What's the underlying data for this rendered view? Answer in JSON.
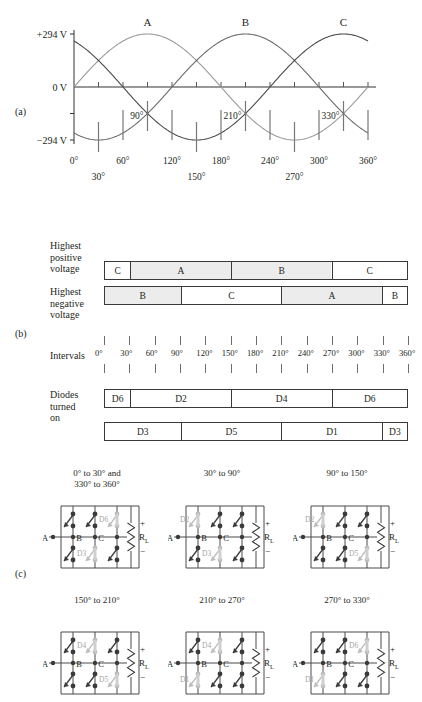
{
  "figure": {
    "panel_labels": {
      "a": "(a)",
      "b": "(b)",
      "c": "(c)"
    }
  },
  "chart_data": {
    "type": "line",
    "title": "",
    "xlabel": "",
    "ylabel": "",
    "xlim": [
      0,
      360
    ],
    "ylim": [
      -294,
      294
    ],
    "grid": false,
    "legend_position": "above-peaks",
    "y_tick_labels": [
      "+294 V",
      "0 V",
      "−294 V"
    ],
    "y_tick_values": [
      294,
      0,
      -294
    ],
    "x_tick_labels_upper": [
      "0°",
      "60°",
      "120°",
      "180°",
      "240°",
      "300°",
      "360°"
    ],
    "x_tick_values_upper": [
      0,
      60,
      120,
      180,
      240,
      300,
      360
    ],
    "x_tick_labels_lower": [
      "30°",
      "150°",
      "270°"
    ],
    "x_tick_values_lower": [
      30,
      150,
      270
    ],
    "inline_annotations": [
      "90°",
      "210°",
      "330°"
    ],
    "inline_annotation_values": [
      90,
      210,
      330
    ],
    "series": [
      {
        "name": "A",
        "phase_deg": 90,
        "amplitude": 294,
        "color": "#9a9a9a",
        "label": "A",
        "label_at_deg": 90
      },
      {
        "name": "B",
        "phase_deg": 210,
        "amplitude": 294,
        "color": "#6b6b6b",
        "label": "B",
        "label_at_deg": 210
      },
      {
        "name": "C",
        "phase_deg": 330,
        "amplitude": 294,
        "color": "#4a4a4a",
        "label": "C",
        "label_at_deg": 330
      }
    ]
  },
  "panel_b": {
    "rows": [
      {
        "label": "Highest\npositive\nvoltage",
        "label_lines": [
          "Highest",
          "positive",
          "voltage"
        ],
        "name": "highest-positive-voltage",
        "segments": [
          {
            "text": "C",
            "start_deg": 0,
            "end_deg": 30,
            "shaded": false
          },
          {
            "text": "A",
            "start_deg": 30,
            "end_deg": 150,
            "shaded": true
          },
          {
            "text": "B",
            "start_deg": 150,
            "end_deg": 270,
            "shaded": true
          },
          {
            "text": "C",
            "start_deg": 270,
            "end_deg": 360,
            "shaded": false
          }
        ]
      },
      {
        "label_lines": [
          "Highest",
          "negative",
          "voltage"
        ],
        "name": "highest-negative-voltage",
        "segments": [
          {
            "text": "B",
            "start_deg": 0,
            "end_deg": 90,
            "shaded": true
          },
          {
            "text": "C",
            "start_deg": 90,
            "end_deg": 210,
            "shaded": false
          },
          {
            "text": "A",
            "start_deg": 210,
            "end_deg": 330,
            "shaded": true
          },
          {
            "text": "B",
            "start_deg": 330,
            "end_deg": 360,
            "shaded": false
          }
        ]
      }
    ],
    "intervals": {
      "label": "Intervals",
      "ticks": [
        "0°",
        "30°",
        "60°",
        "90°",
        "120°",
        "150°",
        "180°",
        "210°",
        "240°",
        "270°",
        "300°",
        "330°",
        "360°"
      ],
      "tick_values": [
        0,
        30,
        60,
        90,
        120,
        150,
        180,
        210,
        240,
        270,
        300,
        330,
        360
      ]
    },
    "diodes": {
      "label_lines": [
        "Diodes",
        "turned",
        "on"
      ],
      "rows": [
        {
          "name": "diodes-upper",
          "segments": [
            {
              "text": "D6",
              "start_deg": 0,
              "end_deg": 30
            },
            {
              "text": "D2",
              "start_deg": 30,
              "end_deg": 150
            },
            {
              "text": "D4",
              "start_deg": 150,
              "end_deg": 270
            },
            {
              "text": "D6",
              "start_deg": 270,
              "end_deg": 360
            }
          ]
        },
        {
          "name": "diodes-lower",
          "segments": [
            {
              "text": "D3",
              "start_deg": 0,
              "end_deg": 90
            },
            {
              "text": "D5",
              "start_deg": 90,
              "end_deg": 210
            },
            {
              "text": "D1",
              "start_deg": 210,
              "end_deg": 330
            },
            {
              "text": "D3",
              "start_deg": 330,
              "end_deg": 360
            }
          ]
        }
      ]
    }
  },
  "panel_c": {
    "node_labels": [
      "A",
      "B",
      "C"
    ],
    "load_label": "R",
    "load_subscript": "L",
    "polarity_plus": "+",
    "polarity_minus": "−",
    "circuits": [
      {
        "name": "circuit-0-30-330-360",
        "title_lines": [
          "0° to 30° and",
          "330° to 360°"
        ],
        "active_top": {
          "label": "D6",
          "branch": 2
        },
        "active_bottom": {
          "label": "D3",
          "branch": 1
        }
      },
      {
        "name": "circuit-30-90",
        "title_lines": [
          "30° to 90°"
        ],
        "active_top": {
          "label": "D2",
          "branch": 0
        },
        "active_bottom": {
          "label": "D3",
          "branch": 1
        }
      },
      {
        "name": "circuit-90-150",
        "title_lines": [
          "90° to 150°"
        ],
        "active_top": {
          "label": "D2",
          "branch": 0
        },
        "active_bottom": {
          "label": "D5",
          "branch": 2
        }
      },
      {
        "name": "circuit-150-210",
        "title_lines": [
          "150° to 210°"
        ],
        "active_top": {
          "label": "D4",
          "branch": 1
        },
        "active_bottom": {
          "label": "D5",
          "branch": 2
        }
      },
      {
        "name": "circuit-210-270",
        "title_lines": [
          "210° to 270°"
        ],
        "active_top": {
          "label": "D4",
          "branch": 1
        },
        "active_bottom": {
          "label": "D1",
          "branch": 0
        }
      },
      {
        "name": "circuit-270-330",
        "title_lines": [
          "270° to 330°"
        ],
        "active_top": {
          "label": "D6",
          "branch": 2
        },
        "active_bottom": {
          "label": "D1",
          "branch": 0
        }
      }
    ]
  }
}
